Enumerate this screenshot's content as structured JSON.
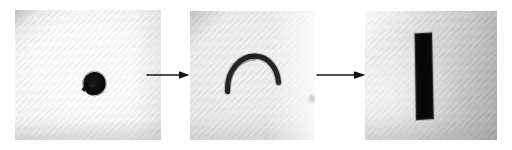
{
  "figure": {
    "kind": "photographic-sequence",
    "panel_count": 3,
    "arrow_count": 2,
    "background_color": "#ffffff",
    "caption": "",
    "title": ""
  },
  "panels": [
    {
      "id": "specimen-initial",
      "name": "panel-specimen-initial",
      "label": "",
      "stage_index": "1",
      "specimen_shape": "coiled-blob",
      "specimen_color": "#0a0a0a",
      "surface": "white woven fabric",
      "surface_color": "#f7f7f7"
    },
    {
      "id": "specimen-bent",
      "name": "panel-specimen-bent",
      "label": "",
      "stage_index": "2",
      "specimen_shape": "arch-curve",
      "specimen_color": "#0a0a0a",
      "surface": "light gray woven fabric",
      "surface_color": "#e6e6e6"
    },
    {
      "id": "specimen-straight",
      "name": "panel-specimen-straight",
      "label": "",
      "stage_index": "3",
      "specimen_shape": "straight-bar",
      "specimen_color": "#0a0a0a",
      "surface": "gray woven fabric",
      "surface_color": "#d2d2d2"
    }
  ],
  "arrows": [
    {
      "id": "coil-to-arc",
      "label": "",
      "direction": "right",
      "color": "#111111"
    },
    {
      "id": "arc-to-bar",
      "label": "",
      "direction": "right",
      "color": "#111111"
    }
  ],
  "annotations": {
    "speck_label": ""
  }
}
